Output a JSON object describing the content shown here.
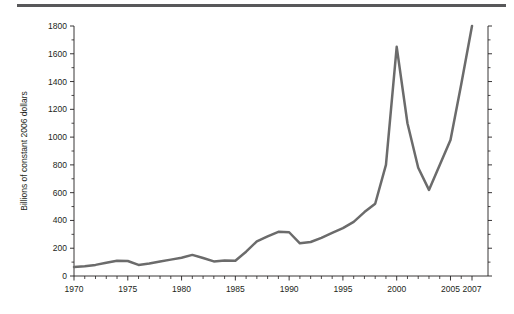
{
  "figure": {
    "top_rule_color": "#58585a",
    "background_color": "#ffffff",
    "axis_color": "#231f20"
  },
  "chart_data": {
    "type": "line",
    "title": "",
    "subtitle": "",
    "xlabel": "",
    "ylabel": "Billions of constant 2006 dollars",
    "xlim": [
      1970,
      2007
    ],
    "ylim": [
      0,
      1800
    ],
    "grid": false,
    "legend": null,
    "line_color": "#6b6b6b",
    "line_width": 2.5,
    "y_ticks_major": [
      0,
      200,
      400,
      600,
      800,
      1000,
      1200,
      1400,
      1600,
      1800
    ],
    "y_tick_labels": [
      "0",
      "200",
      "400",
      "600",
      "800",
      "1000",
      "1200",
      "1400",
      "1600",
      "1800"
    ],
    "y_ticks_minor": [
      100,
      300,
      500,
      700,
      900,
      1100,
      1300,
      1500,
      1700
    ],
    "x_ticks_major": [
      1970,
      1975,
      1980,
      1985,
      1990,
      1995,
      2000,
      2005,
      2007
    ],
    "x_tick_labels": [
      "1970",
      "1975",
      "1980",
      "1985",
      "1990",
      "1995",
      "2000",
      "2005",
      "2007"
    ],
    "x_ticks_minor": [
      1971,
      1972,
      1973,
      1974,
      1976,
      1977,
      1978,
      1979,
      1981,
      1982,
      1983,
      1984,
      1986,
      1987,
      1988,
      1989,
      1991,
      1992,
      1993,
      1994,
      1996,
      1997,
      1998,
      1999,
      2001,
      2002,
      2003,
      2004,
      2006
    ],
    "x": [
      1970,
      1971,
      1972,
      1973,
      1974,
      1975,
      1976,
      1977,
      1978,
      1979,
      1980,
      1981,
      1982,
      1983,
      1984,
      1985,
      1986,
      1987,
      1988,
      1989,
      1990,
      1991,
      1992,
      1993,
      1994,
      1995,
      1996,
      1997,
      1998,
      1999,
      2000,
      2001,
      2002,
      2003,
      2004,
      2005,
      2006,
      2007
    ],
    "values": [
      65,
      70,
      80,
      95,
      110,
      108,
      80,
      90,
      105,
      118,
      132,
      152,
      130,
      105,
      112,
      110,
      175,
      250,
      285,
      318,
      315,
      235,
      245,
      275,
      310,
      345,
      390,
      460,
      520,
      800,
      1650,
      1100,
      780,
      620,
      800,
      980,
      1380,
      1800
    ],
    "annotations": []
  }
}
